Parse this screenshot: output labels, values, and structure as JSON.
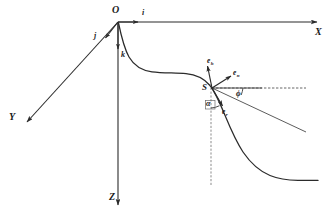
{
  "figure": {
    "background_color": "#ffffff",
    "line_color": "#2b2b2b",
    "thin_line_color": "#555555",
    "width": 331,
    "height": 222
  },
  "axes": {
    "origin_label": "O",
    "x_label": "X",
    "y_label": "Y",
    "z_label": "Z"
  },
  "unit_vectors": {
    "i_label": "i",
    "j_label": "j",
    "k_label": "k"
  },
  "point": {
    "s_label": "S"
  },
  "local_frame": {
    "e_h": {
      "base": "e",
      "sub": "h"
    },
    "e_n": {
      "base": "e",
      "sub": "n"
    },
    "e_r": {
      "base": "e",
      "sub": "r"
    }
  },
  "angles": {
    "alpha_label": "α",
    "phi_label": "ϕ"
  },
  "geometry": {
    "origin": [
      118,
      22
    ],
    "x_axis_end": [
      320,
      22
    ],
    "y_axis_end": [
      25,
      124
    ],
    "z_axis_end": [
      118,
      208
    ],
    "station": [
      212,
      88
    ],
    "i_arrow_at": [
      140,
      22
    ],
    "j_arrow_at": [
      104,
      40
    ],
    "k_arrow_at": [
      118,
      51
    ]
  }
}
